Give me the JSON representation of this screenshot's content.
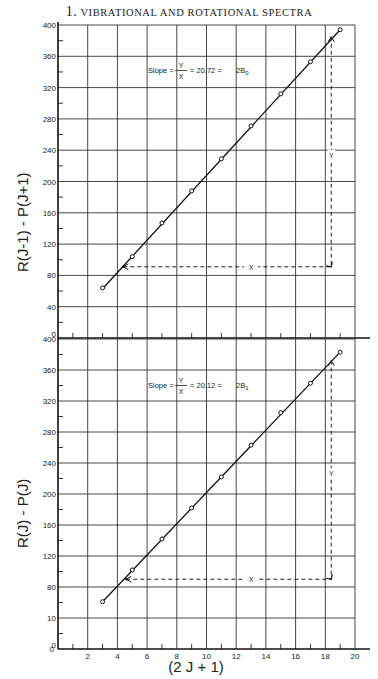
{
  "header": {
    "number": "1.",
    "title": "VIBRATIONAL AND ROTATIONAL SPECTRA"
  },
  "chart_data": [
    {
      "type": "line",
      "title": "",
      "xlabel": "(2J+1)",
      "ylabel": "R(J-1) - P(J+1)",
      "xlim": [
        0,
        20
      ],
      "ylim": [
        0,
        400
      ],
      "xticks": [
        2,
        4,
        6,
        8,
        10,
        12,
        14,
        16,
        18,
        20
      ],
      "yticks": [
        0,
        40,
        80,
        120,
        160,
        200,
        240,
        280,
        320,
        360,
        400
      ],
      "grid": true,
      "series": [
        {
          "name": "measured",
          "x": [
            3,
            5,
            7,
            9,
            11,
            13,
            15,
            17,
            19
          ],
          "values": [
            64,
            104,
            147,
            188,
            229,
            271,
            312,
            353,
            394
          ]
        }
      ],
      "fit_line": {
        "x": [
          3,
          19
        ],
        "y": [
          63,
          394
        ]
      },
      "annotation": {
        "text": "Slope = Y/X = 20.72 = 2B",
        "subscript": "0",
        "slope": 20.72
      },
      "construction": {
        "x_from": 4.4,
        "x_to": 18.4,
        "y_at": 91,
        "y_top": 385,
        "x_label": "X",
        "y_label": "Y"
      }
    },
    {
      "type": "line",
      "title": "",
      "xlabel": "(2J+1)",
      "ylabel": "R(J) - P(J)",
      "xlim": [
        0,
        20
      ],
      "ylim": [
        0,
        400
      ],
      "xticks": [
        2,
        4,
        6,
        8,
        10,
        12,
        14,
        16,
        18,
        20
      ],
      "yticks": [
        0,
        40,
        80,
        120,
        160,
        200,
        240,
        280,
        320,
        360,
        400
      ],
      "grid": true,
      "series": [
        {
          "name": "measured",
          "x": [
            3,
            5,
            7,
            9,
            11,
            13,
            15,
            17,
            19
          ],
          "values": [
            61,
            102,
            142,
            182,
            222,
            263,
            305,
            343,
            383
          ]
        }
      ],
      "fit_line": {
        "x": [
          3,
          19
        ],
        "y": [
          61,
          383
        ]
      },
      "annotation": {
        "text": "Slope = Y/X = 20.12 = 2B",
        "subscript": "1",
        "slope": 20.12
      },
      "construction": {
        "x_from": 4.6,
        "x_to": 18.4,
        "y_at": 90,
        "y_top": 372,
        "x_label": "X",
        "y_label": "Y"
      }
    }
  ],
  "labels": {
    "upper_ylabel": "R(J-1) - P(J+1)",
    "lower_ylabel": "R(J) - P(J)",
    "xlabel": "(2 J + 1)",
    "upper_ytick_text": [
      "0",
      "40",
      "80",
      "120",
      "160",
      "200",
      "240",
      "280",
      "320",
      "360",
      "400"
    ],
    "lower_ytick_text": [
      "0",
      "10",
      "80",
      "120",
      "160",
      "200",
      "240",
      "280",
      "320",
      "360",
      "400"
    ],
    "xtick_text": [
      "2",
      "4",
      "6",
      "8",
      "10",
      "12",
      "14",
      "16",
      "18",
      "20"
    ],
    "slope_word": "Slope",
    "frac_num": "Y",
    "frac_den": "X",
    "upper_value": "20.72",
    "lower_value": "20.12",
    "upper_B": "2B",
    "upper_sub": "0",
    "lower_B": "2B",
    "lower_sub": "1",
    "x_mark": "X",
    "y_mark": "Y"
  }
}
